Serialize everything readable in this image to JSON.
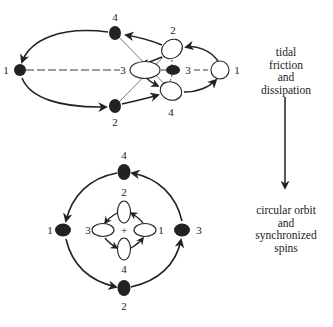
{
  "top_diagram": {
    "labels": {
      "left_black": "1",
      "upper_black": "4",
      "lower_black": "2",
      "center_white": "3",
      "small_black": "3",
      "upper_white": "2",
      "lower_white": "4",
      "right_white": "1"
    }
  },
  "bottom_diagram": {
    "labels": {
      "top_black": "4",
      "inner_top_white": "2",
      "left_black": "1",
      "inner_left_white": "3",
      "center": "+",
      "inner_right_white": "1",
      "right_black": "3",
      "inner_bottom_white": "4",
      "bottom_black": "2"
    }
  },
  "process": {
    "top_text": [
      "tidal",
      "friction",
      "and",
      "dissipation"
    ],
    "bottom_text": [
      "circular orbit",
      "and",
      "synchronized",
      "spins"
    ]
  },
  "colors": {
    "ink": "#222222",
    "background": "#ffffff"
  }
}
